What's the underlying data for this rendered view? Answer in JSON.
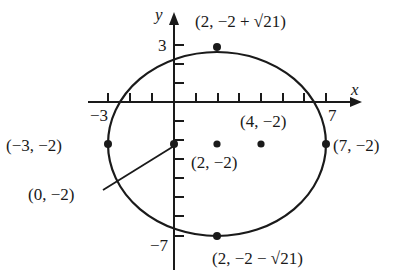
{
  "diagram": {
    "type": "ellipse-on-coordinate-plane",
    "axes": {
      "x_label": "x",
      "y_label": "y",
      "x_tick_labels": {
        "neg": "−3",
        "pos": "7"
      },
      "y_tick_labels": {
        "pos": "3",
        "neg": "−7"
      }
    },
    "ellipse": {
      "center": [
        2,
        -2
      ],
      "semi_major_x": 5,
      "semi_minor_y": "√21"
    },
    "points": {
      "top": {
        "label": "(2, −2 + √21)"
      },
      "bottom": {
        "label": "(2, −2 − √21)"
      },
      "left": {
        "label": "(−3, −2)"
      },
      "right": {
        "label": "(7, −2)"
      },
      "center": {
        "label": "(2, −2)"
      },
      "focus": {
        "label": "(4, −2)"
      },
      "y_intercept": {
        "label": "(0, −2)"
      }
    },
    "colors": {
      "ink": "#1a1a1a",
      "background": "#ffffff"
    }
  }
}
